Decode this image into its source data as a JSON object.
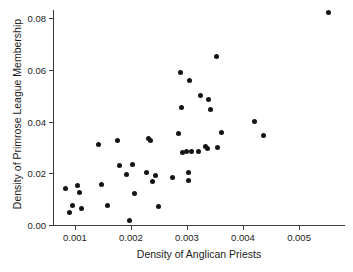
{
  "chart_data": {
    "type": "scatter",
    "title": "",
    "xlabel": "Density of Anglican Priests",
    "ylabel": "Density of Primrose League Membership",
    "xlim": [
      0.00061,
      0.00582
    ],
    "ylim": [
      0.0,
      0.0832
    ],
    "grid": false,
    "legend": null,
    "xticks": [
      0.001,
      0.002,
      0.003,
      0.004,
      0.005
    ],
    "xticklabels": [
      "0.001",
      "0.002",
      "0.003",
      "0.004",
      "0.005"
    ],
    "yticks": [
      0.0,
      0.02,
      0.04,
      0.06,
      0.08
    ],
    "yticklabels": [
      "0.00",
      "0.02",
      "0.04",
      "0.06",
      "0.08"
    ],
    "marker": "circle",
    "marker_color": "#141414",
    "points": [
      {
        "x": 0.00083,
        "y": 0.0143
      },
      {
        "x": 0.0009,
        "y": 0.0048
      },
      {
        "x": 0.00095,
        "y": 0.0077
      },
      {
        "x": 0.00105,
        "y": 0.0152
      },
      {
        "x": 0.00108,
        "y": 0.0127
      },
      {
        "x": 0.00112,
        "y": 0.0065
      },
      {
        "x": 0.00143,
        "y": 0.031
      },
      {
        "x": 0.00147,
        "y": 0.0157
      },
      {
        "x": 0.00158,
        "y": 0.0075
      },
      {
        "x": 0.00176,
        "y": 0.0327
      },
      {
        "x": 0.0018,
        "y": 0.0232
      },
      {
        "x": 0.00192,
        "y": 0.0195
      },
      {
        "x": 0.00197,
        "y": 0.0017
      },
      {
        "x": 0.00202,
        "y": 0.0233
      },
      {
        "x": 0.00207,
        "y": 0.0122
      },
      {
        "x": 0.00228,
        "y": 0.0204
      },
      {
        "x": 0.00232,
        "y": 0.0336
      },
      {
        "x": 0.00235,
        "y": 0.0326
      },
      {
        "x": 0.00238,
        "y": 0.0169
      },
      {
        "x": 0.00243,
        "y": 0.0193
      },
      {
        "x": 0.0025,
        "y": 0.0073
      },
      {
        "x": 0.00275,
        "y": 0.0184
      },
      {
        "x": 0.00285,
        "y": 0.0355
      },
      {
        "x": 0.00288,
        "y": 0.059
      },
      {
        "x": 0.0029,
        "y": 0.0454
      },
      {
        "x": 0.00292,
        "y": 0.028
      },
      {
        "x": 0.00299,
        "y": 0.0283
      },
      {
        "x": 0.00302,
        "y": 0.0173
      },
      {
        "x": 0.00303,
        "y": 0.0204
      },
      {
        "x": 0.00305,
        "y": 0.056
      },
      {
        "x": 0.00308,
        "y": 0.0283
      },
      {
        "x": 0.0032,
        "y": 0.0284
      },
      {
        "x": 0.00325,
        "y": 0.0501
      },
      {
        "x": 0.00333,
        "y": 0.0303
      },
      {
        "x": 0.00336,
        "y": 0.0296
      },
      {
        "x": 0.00338,
        "y": 0.0486
      },
      {
        "x": 0.00342,
        "y": 0.0447
      },
      {
        "x": 0.00352,
        "y": 0.0651
      },
      {
        "x": 0.00355,
        "y": 0.0299
      },
      {
        "x": 0.00362,
        "y": 0.0357
      },
      {
        "x": 0.00421,
        "y": 0.0401
      },
      {
        "x": 0.00437,
        "y": 0.0347
      },
      {
        "x": 0.00553,
        "y": 0.0821
      }
    ]
  }
}
